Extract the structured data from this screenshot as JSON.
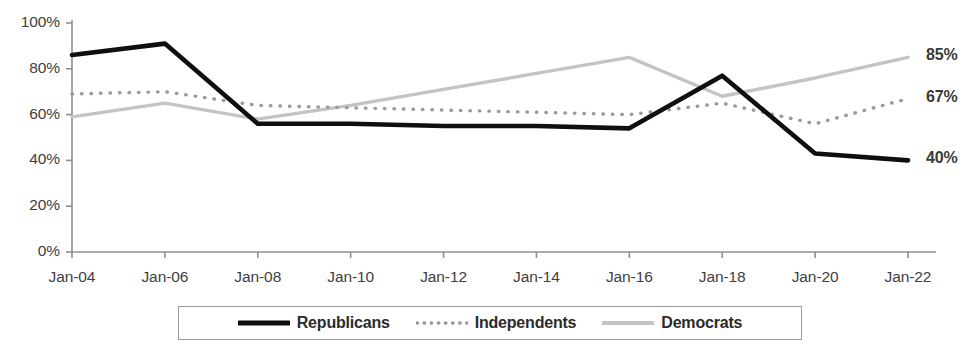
{
  "chart_data": {
    "type": "line",
    "title": "",
    "xlabel": "",
    "ylabel": "",
    "categories": [
      "Jan-04",
      "Jan-06",
      "Jan-08",
      "Jan-10",
      "Jan-12",
      "Jan-14",
      "Jan-16",
      "Jan-18",
      "Jan-20",
      "Jan-22"
    ],
    "x_tick_labels": [
      "Jan-04",
      "Jan-06",
      "Jan-08",
      "Jan-10",
      "Jan-12",
      "Jan-14",
      "Jan-16",
      "Jan-18",
      "Jan-20",
      "Jan-22"
    ],
    "y_tick_labels": [
      "0%",
      "20%",
      "40%",
      "60%",
      "80%",
      "100%"
    ],
    "y_tick_values": [
      0,
      20,
      40,
      60,
      80,
      100
    ],
    "ylim": [
      0,
      100
    ],
    "grid": false,
    "legend_position": "bottom",
    "series": [
      {
        "name": "Republicans",
        "style": "solid-thick",
        "color": "#0f0f0f",
        "values": [
          86,
          91,
          56,
          56,
          55,
          55,
          54,
          77,
          43,
          40
        ],
        "end_label": "40%"
      },
      {
        "name": "Independents",
        "style": "dotted",
        "color": "#8c8c8c",
        "values": [
          69,
          70,
          64,
          63,
          62,
          61,
          60,
          65,
          56,
          67
        ],
        "end_label": "67%"
      },
      {
        "name": "Democrats",
        "style": "solid-light",
        "color": "#c4c4c4",
        "values": [
          59,
          65,
          58,
          64,
          71,
          78,
          85,
          68,
          76,
          85
        ],
        "end_label": "85%"
      }
    ],
    "end_labels": [
      {
        "text": "85%",
        "series": "Democrats"
      },
      {
        "text": "67%",
        "series": "Independents"
      },
      {
        "text": "40%",
        "series": "Republicans"
      }
    ]
  },
  "legend": {
    "items": [
      {
        "label": "Republicans",
        "swatch": "solid-thick-swatch"
      },
      {
        "label": "Independents",
        "swatch": "dotted-swatch"
      },
      {
        "label": "Democrats",
        "swatch": "solid-light-swatch"
      }
    ]
  },
  "axis": {
    "line_color": "#8f8f8f"
  }
}
